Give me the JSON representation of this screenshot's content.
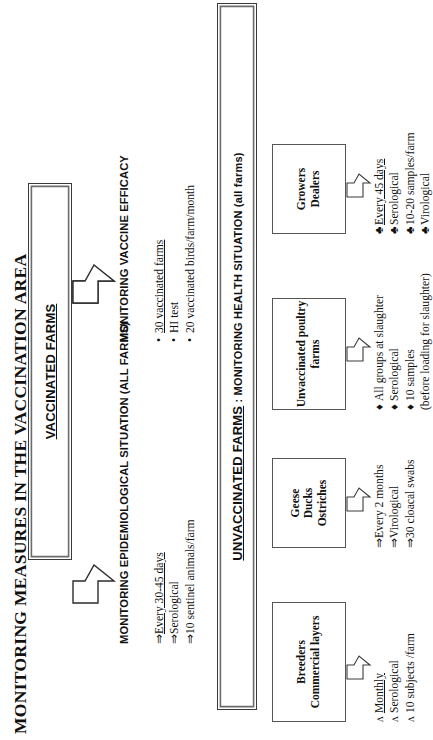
{
  "title": "MONITORING MEASURES IN THE VACCINATION AREA",
  "vaccinated": {
    "box_label": "VACCINATED FARMS",
    "branches": [
      {
        "heading": "MONITORING VACCINE EFFICACY",
        "marker": "•",
        "items": [
          {
            "marker": "•",
            "text": "30 vaccinated farms",
            "underline": true
          },
          {
            "marker": "•",
            "text": "HI test",
            "underline": false
          },
          {
            "marker": "•",
            "text": "20 vaccinated birds/farm/month",
            "underline": false
          }
        ]
      },
      {
        "heading": "MONITORING EPIDEMIOLOGICAL SITUATION (ALL FARMS)",
        "marker": "⇒",
        "items": [
          {
            "marker": "⇒",
            "text": "Every 30-45 days",
            "underline": true
          },
          {
            "marker": "⇒",
            "text": "Serological",
            "underline": false
          },
          {
            "marker": "⇒",
            "text": "10 sentinel animals/farm",
            "underline": false
          }
        ]
      }
    ]
  },
  "unvaccinated": {
    "box_label_strong": "UNVACCINATED FARMS",
    "box_label_rest": " : MONITORING HEALTH SITUATION (all farms)",
    "categories": [
      {
        "name": "breeders",
        "lines": [
          "Breeders",
          "Commercial layers"
        ],
        "items": [
          {
            "marker": "ʌ",
            "text": "Monthly",
            "underline": true
          },
          {
            "marker": "ʌ",
            "text": "Serological",
            "underline": false
          },
          {
            "marker": "ʌ",
            "text": "10 subjects /farm",
            "underline": false
          }
        ]
      },
      {
        "name": "geese",
        "lines": [
          "Geese",
          "Ducks",
          "Ostriches"
        ],
        "items": [
          {
            "marker": "⇒",
            "text": "Every 2 months",
            "underline": false
          },
          {
            "marker": "⇒",
            "text": "Virological",
            "underline": false
          },
          {
            "marker": "⇒",
            "text": "30 cloacal swabs",
            "underline": false
          }
        ]
      },
      {
        "name": "unvaccinated-poultry-farms",
        "lines": [
          "Unvaccinated poultry",
          "farms"
        ],
        "items": [
          {
            "marker": "♦",
            "text": "All groups at slaughter",
            "underline": false
          },
          {
            "marker": "♦",
            "text": "Serological",
            "underline": false
          },
          {
            "marker": "♦",
            "text": "10 samples",
            "underline": false
          }
        ],
        "note": "(before loading for slaughter)"
      },
      {
        "name": "growers-dealers",
        "lines": [
          "Growers",
          "Dealers"
        ],
        "items": [
          {
            "marker": "♣",
            "text": "Every 45 days",
            "underline": true
          },
          {
            "marker": "♣",
            "text": "Serological",
            "underline": false
          },
          {
            "marker": "♣",
            "text": "10-20 samples/farm",
            "underline": false
          },
          {
            "marker": "♣",
            "text": "Virological",
            "underline": false
          }
        ]
      }
    ]
  },
  "icons": {
    "big_arrow": "block-arrow-down-icon",
    "small_arrow": "block-arrow-down-small-icon"
  },
  "colors": {
    "ink": "#111111",
    "box_border": "#3a3a3a",
    "box_border_outer": "#6b6b6b",
    "background": "#ffffff"
  }
}
